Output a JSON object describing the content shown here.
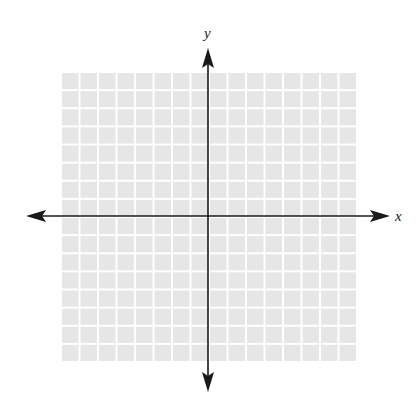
{
  "graph": {
    "type": "coordinate-plane",
    "x_axis_label": "x",
    "y_axis_label": "y",
    "grid": {
      "columns": 16,
      "rows": 16,
      "left_of_y_axis": 8,
      "right_of_y_axis": 8,
      "above_x_axis": 8,
      "below_x_axis": 8,
      "fill_color": "#e6e6e6",
      "line_color": "#ffffff"
    },
    "axis_color": "#1a1a1a"
  }
}
